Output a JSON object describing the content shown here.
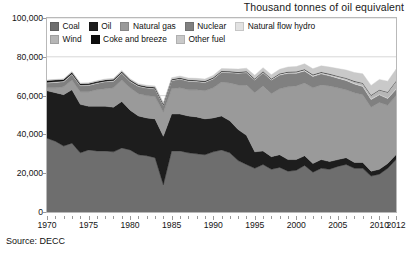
{
  "chart_data": {
    "type": "area",
    "title": "Thousand tonnes of oil equivalent",
    "subtitle": "",
    "xlabel": "",
    "ylabel": "",
    "source": "Source: DECC",
    "stacked": true,
    "grid": true,
    "legend_position": "top-left-inside",
    "xlim": [
      1970,
      2012
    ],
    "ylim": [
      0,
      100000
    ],
    "ytick_labels": [
      "0",
      "20,000",
      "40,000",
      "60,000",
      "80,000",
      "100,000"
    ],
    "yticks": [
      0,
      20000,
      40000,
      60000,
      80000,
      100000
    ],
    "xtick_labels": [
      "1970",
      "1975",
      "1980",
      "1985",
      "1990",
      "1995",
      "2000",
      "2005",
      "2010",
      "2012"
    ],
    "xticks": [
      1970,
      1975,
      1980,
      1985,
      1990,
      1995,
      2000,
      2005,
      2010,
      2012
    ],
    "x": [
      1970,
      1971,
      1972,
      1973,
      1974,
      1975,
      1976,
      1977,
      1978,
      1979,
      1980,
      1981,
      1982,
      1983,
      1984,
      1985,
      1986,
      1987,
      1988,
      1989,
      1990,
      1991,
      1992,
      1993,
      1994,
      1995,
      1996,
      1997,
      1998,
      1999,
      2000,
      2001,
      2002,
      2003,
      2004,
      2005,
      2006,
      2007,
      2008,
      2009,
      2010,
      2011,
      2012
    ],
    "series": [
      {
        "name": "Coal",
        "color": "#6e6e6e",
        "values": [
          38000,
          36500,
          34000,
          35500,
          30500,
          32000,
          31500,
          31500,
          31000,
          33000,
          32000,
          29500,
          29000,
          28000,
          14000,
          31500,
          31500,
          30500,
          30000,
          29500,
          31000,
          32000,
          30500,
          26500,
          24500,
          22500,
          24500,
          22000,
          23000,
          21000,
          21500,
          24000,
          20500,
          22500,
          22000,
          23500,
          24500,
          22500,
          22500,
          18500,
          19500,
          22500,
          27000
        ]
      },
      {
        "name": "Oil",
        "color": "#1d1d1d",
        "values": [
          24500,
          25000,
          26500,
          27500,
          25000,
          22500,
          23000,
          23000,
          23000,
          24000,
          20500,
          20000,
          19500,
          20000,
          25000,
          19000,
          19000,
          19000,
          19000,
          18500,
          17500,
          17500,
          16500,
          16000,
          15000,
          8500,
          7000,
          6500,
          6500,
          6000,
          5500,
          5000,
          4500,
          4500,
          4000,
          3500,
          3500,
          3000,
          3000,
          2500,
          2500,
          2500,
          2500
        ]
      },
      {
        "name": "Natural gas",
        "color": "#9a9a9a",
        "values": [
          1500,
          2500,
          4000,
          5000,
          6500,
          7500,
          8500,
          9000,
          10000,
          11000,
          11500,
          11500,
          11500,
          11500,
          12500,
          13000,
          13500,
          13500,
          14000,
          14500,
          15500,
          17500,
          19500,
          23000,
          26000,
          30500,
          33500,
          32500,
          34000,
          37500,
          38000,
          37500,
          39000,
          38500,
          39000,
          37000,
          35000,
          36000,
          35000,
          33000,
          34500,
          30000,
          30500
        ]
      },
      {
        "name": "Nuclear",
        "color": "#808080",
        "values": [
          2500,
          2800,
          2700,
          2900,
          3100,
          3200,
          3300,
          3600,
          3400,
          3500,
          3300,
          3700,
          3900,
          4000,
          3500,
          4200,
          4500,
          4400,
          4200,
          4300,
          4600,
          5000,
          5300,
          6000,
          6300,
          6500,
          6800,
          7000,
          7100,
          7000,
          6500,
          6200,
          5900,
          5700,
          5200,
          5000,
          4800,
          4500,
          4200,
          4000,
          3900,
          3500,
          3300
        ]
      },
      {
        "name": "Natural flow hydro",
        "color": "#e2e2e2",
        "values": [
          350,
          380,
          360,
          370,
          340,
          360,
          300,
          360,
          380,
          350,
          330,
          350,
          320,
          340,
          310,
          330,
          340,
          350,
          360,
          330,
          330,
          340,
          340,
          350,
          360,
          340,
          320,
          330,
          350,
          380,
          380,
          350,
          360,
          320,
          330,
          340,
          350,
          330,
          340,
          330,
          280,
          320,
          350
        ]
      },
      {
        "name": "Wind",
        "color": "#b6b6b6",
        "values": [
          0,
          0,
          0,
          0,
          0,
          0,
          0,
          0,
          0,
          0,
          0,
          0,
          0,
          0,
          0,
          0,
          0,
          0,
          0,
          0,
          10,
          20,
          30,
          40,
          60,
          80,
          110,
          140,
          180,
          220,
          280,
          320,
          380,
          420,
          500,
          620,
          780,
          1000,
          1350,
          1800,
          2200,
          2900,
          3800
        ]
      },
      {
        "name": "Coke and breeze",
        "color": "#0d0d0d",
        "values": [
          900,
          850,
          800,
          780,
          700,
          680,
          660,
          640,
          620,
          600,
          500,
          480,
          460,
          440,
          350,
          420,
          400,
          400,
          390,
          380,
          370,
          360,
          340,
          320,
          300,
          290,
          280,
          270,
          260,
          250,
          240,
          230,
          220,
          210,
          200,
          190,
          180,
          170,
          160,
          140,
          150,
          140,
          130
        ]
      },
      {
        "name": "Other fuel",
        "color": "#c9c9c9",
        "values": [
          300,
          320,
          340,
          360,
          380,
          400,
          420,
          450,
          480,
          520,
          560,
          600,
          650,
          700,
          750,
          800,
          850,
          900,
          950,
          1000,
          1100,
          1200,
          1300,
          1450,
          1600,
          1750,
          1900,
          2050,
          2200,
          2400,
          2600,
          2800,
          3000,
          3200,
          3500,
          3800,
          4100,
          4400,
          4700,
          5000,
          5300,
          5600,
          6000
        ]
      }
    ]
  },
  "legend": {
    "rows": [
      [
        {
          "label": "Coal",
          "color": "#6e6e6e"
        },
        {
          "label": "Oil",
          "color": "#1d1d1d"
        },
        {
          "label": "Natural gas",
          "color": "#9a9a9a"
        },
        {
          "label": "Nuclear",
          "color": "#808080"
        },
        {
          "label": "Natural flow hydro",
          "color": "#e2e2e2"
        }
      ],
      [
        {
          "label": "Wind",
          "color": "#b6b6b6"
        },
        {
          "label": "Coke and breeze",
          "color": "#0d0d0d"
        },
        {
          "label": "Other fuel",
          "color": "#c9c9c9"
        }
      ]
    ]
  },
  "colors": {
    "plot_border": "#b9b9b9",
    "gridline": "#d8d8d8",
    "background": "#ffffff",
    "text": "#141414"
  }
}
